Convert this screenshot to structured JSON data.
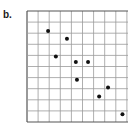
{
  "panel_label": "b.",
  "chart_data": {
    "type": "scatter",
    "title": "",
    "xlabel": "",
    "ylabel": "",
    "grid": true,
    "grid_cells": {
      "columns": 9.2,
      "rows": 10
    },
    "xlim": [
      0,
      9.2
    ],
    "ylim": [
      0,
      10
    ],
    "points": [
      {
        "x": 1.9,
        "y": 8.2
      },
      {
        "x": 3.6,
        "y": 7.5
      },
      {
        "x": 2.6,
        "y": 5.9
      },
      {
        "x": 4.4,
        "y": 5.4
      },
      {
        "x": 5.5,
        "y": 5.4
      },
      {
        "x": 4.5,
        "y": 3.8
      },
      {
        "x": 7.3,
        "y": 3.1
      },
      {
        "x": 6.5,
        "y": 2.3
      },
      {
        "x": 8.6,
        "y": 0.7
      }
    ],
    "colors": {
      "grid": "#9a9a9a",
      "border": "#555555",
      "point": "#111111"
    }
  }
}
